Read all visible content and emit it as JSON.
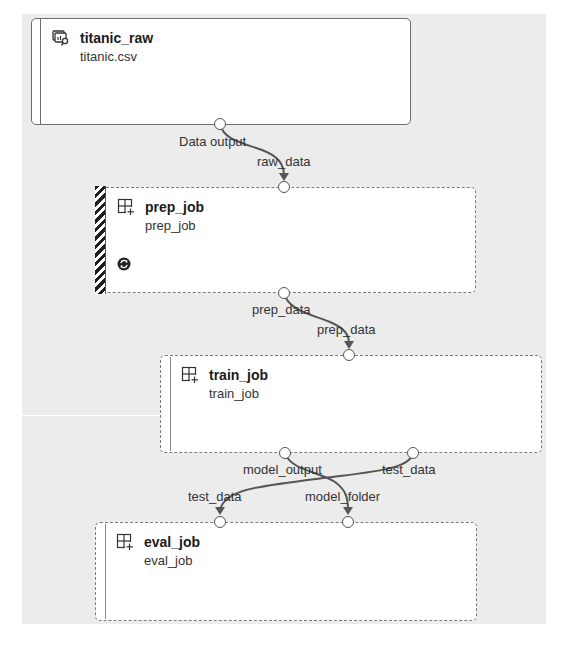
{
  "colors": {
    "canvas_bg": "#ececec",
    "node_bg": "#ffffff",
    "edge": "#555555",
    "border": "#7a7a7a"
  },
  "nodes": {
    "titanic_raw": {
      "title": "titanic_raw",
      "subtitle": "titanic.csv",
      "icon": "dataset-icon",
      "output_port": "Data output"
    },
    "prep_job": {
      "title": "prep_job",
      "subtitle": "prep_job",
      "icon": "component-icon",
      "status_icon": "running-icon",
      "input_port": "raw_data",
      "output_port": "prep_data"
    },
    "train_job": {
      "title": "train_job",
      "subtitle": "train_job",
      "icon": "component-icon",
      "input_port": "prep_data",
      "output_ports": [
        "model_output",
        "test_data"
      ]
    },
    "eval_job": {
      "title": "eval_job",
      "subtitle": "eval_job",
      "icon": "component-icon",
      "input_ports": [
        "test_data",
        "model_folder"
      ]
    }
  },
  "edges": [
    {
      "from": "titanic_raw.Data output",
      "to": "prep_job.raw_data"
    },
    {
      "from": "prep_job.prep_data",
      "to": "train_job.prep_data"
    },
    {
      "from": "train_job.model_output",
      "to": "eval_job.model_folder"
    },
    {
      "from": "train_job.test_data",
      "to": "eval_job.test_data"
    }
  ]
}
